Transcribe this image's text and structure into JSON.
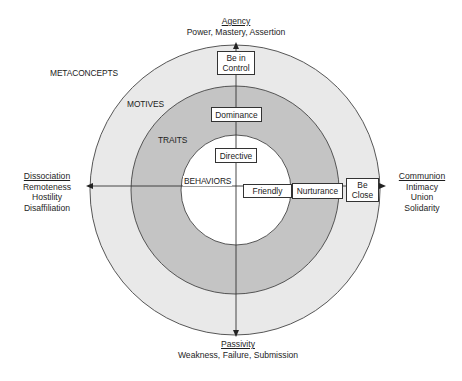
{
  "poles": {
    "top": {
      "title": "Agency",
      "subtitle": "Power, Mastery, Assertion"
    },
    "bottom": {
      "title": "Passivity",
      "subtitle": "Weakness, Failure, Submission"
    },
    "left": {
      "title": "Dissociation",
      "lines": [
        "Remoteness",
        "Hostility",
        "Disaffiliation"
      ]
    },
    "right": {
      "title": "Communion",
      "lines": [
        "Intimacy",
        "Union",
        "Solidarity"
      ]
    }
  },
  "rings": {
    "metaconcepts": "METACONCEPTS",
    "motives": "MOTIVES",
    "traits": "TRAITS",
    "behaviors": "BEHAVIORS"
  },
  "boxes": {
    "be_in_control": "Be in\nControl",
    "dominance": "Dominance",
    "directive": "Directive",
    "friendly": "Friendly",
    "nurturance": "Nurturance",
    "be_close": "Be\nClose"
  },
  "colors": {
    "outer_ring": "#e9e9e9",
    "middle_ring": "#c4c4c4",
    "inner_circle": "#ffffff",
    "lines": "#333333"
  }
}
